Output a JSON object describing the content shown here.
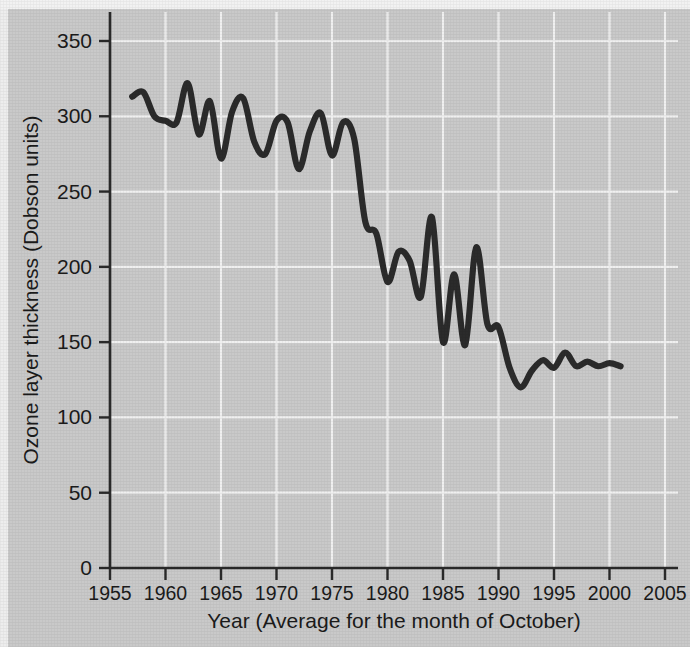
{
  "chart_data": {
    "type": "line",
    "title": "",
    "xlabel": "Year (Average for the month of October)",
    "ylabel": "Ozone layer thickness (Dobson units)",
    "xlim": [
      1955,
      2005
    ],
    "ylim": [
      0,
      360
    ],
    "grid": true,
    "legend_position": "none",
    "xticks": [
      1955,
      1960,
      1965,
      1970,
      1975,
      1980,
      1985,
      1990,
      1995,
      2000,
      2005
    ],
    "xtick_labels": [
      "1955",
      "1960",
      "1965",
      "1970",
      "1975",
      "1980",
      "1985",
      "1990",
      "1995",
      "2000",
      "2005"
    ],
    "yticks": [
      0,
      50,
      100,
      150,
      200,
      250,
      300,
      350
    ],
    "ytick_labels": [
      "0",
      "50",
      "100",
      "150",
      "200",
      "250",
      "300",
      "350"
    ],
    "line_color": "#2b2b2b",
    "background_color": "#c9c9c9",
    "gridline_color": "#f0f0f0",
    "series": [
      {
        "name": "Ozone layer thickness",
        "x": [
          1957,
          1958,
          1959,
          1960,
          1961,
          1962,
          1963,
          1964,
          1965,
          1966,
          1967,
          1968,
          1969,
          1970,
          1971,
          1972,
          1973,
          1974,
          1975,
          1976,
          1977,
          1978,
          1979,
          1980,
          1981,
          1982,
          1983,
          1984,
          1985,
          1986,
          1987,
          1988,
          1989,
          1990,
          1991,
          1992,
          1993,
          1994,
          1995,
          1996,
          1997,
          1998,
          1999,
          2000,
          2001
        ],
        "values": [
          313,
          316,
          300,
          297,
          296,
          322,
          288,
          310,
          272,
          303,
          312,
          283,
          275,
          297,
          296,
          265,
          290,
          302,
          274,
          296,
          285,
          230,
          222,
          190,
          210,
          204,
          180,
          233,
          150,
          195,
          148,
          213,
          162,
          160,
          133,
          120,
          131,
          138,
          133,
          143,
          134,
          137,
          134,
          136,
          134
        ]
      }
    ]
  },
  "axes": {
    "y_title": "Ozone layer thickness (Dobson units)",
    "x_title": "Year (Average for the month of October)"
  }
}
